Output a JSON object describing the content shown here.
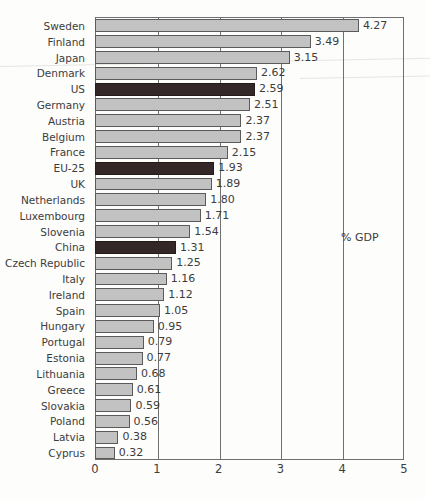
{
  "chart_data": {
    "type": "bar",
    "orientation": "horizontal",
    "title": "",
    "xlabel": "",
    "ylabel": "",
    "annotation": "% GDP",
    "xlim": [
      0,
      5
    ],
    "xticks": [
      "0",
      "1",
      "2",
      "3",
      "4",
      "5"
    ],
    "grid": true,
    "grid_axis": "x",
    "legend": "none",
    "colors": {
      "bar_default": "#c2c2c2",
      "bar_highlight": "#332827",
      "bar_outline": "#5a5a5a",
      "axis": "#6f6f6f",
      "text": "#3c3c3c",
      "background": "#fdfdfc"
    },
    "categories": [
      "Sweden",
      "Finland",
      "Japan",
      "Denmark",
      "US",
      "Germany",
      "Austria",
      "Belgium",
      "France",
      "EU-25",
      "UK",
      "Netherlands",
      "Luxembourg",
      "Slovenia",
      "China",
      "Czech Republic",
      "Italy",
      "Ireland",
      "Spain",
      "Hungary",
      "Portugal",
      "Estonia",
      "Lithuania",
      "Greece",
      "Slovakia",
      "Poland",
      "Latvia",
      "Cyprus"
    ],
    "values": [
      4.27,
      3.49,
      3.15,
      2.62,
      2.59,
      2.51,
      2.37,
      2.37,
      2.15,
      1.93,
      1.89,
      1.8,
      1.71,
      1.54,
      1.31,
      1.25,
      1.16,
      1.12,
      1.05,
      0.95,
      0.79,
      0.77,
      0.68,
      0.61,
      0.59,
      0.56,
      0.38,
      0.32
    ],
    "value_labels": [
      "4.27",
      "3.49",
      "3.15",
      "2.62",
      "2.59",
      "2.51",
      "2.37",
      "2.37",
      "2.15",
      "1.93",
      "1.89",
      "1.80",
      "1.71",
      "1.54",
      "1.31",
      "1.25",
      "1.16",
      "1.12",
      "1.05",
      "0.95",
      "0.79",
      "0.77",
      "0.68",
      "0.61",
      "0.59",
      "0.56",
      "0.38",
      "0.32"
    ],
    "highlighted": [
      "US",
      "EU-25",
      "China"
    ]
  }
}
